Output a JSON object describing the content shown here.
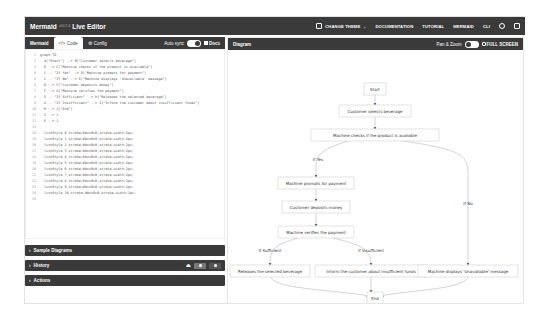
{
  "navbar": {
    "brand": "Mermaid",
    "version": "v10.2.4",
    "product": "Live Editor",
    "links": [
      "CHANGE THEME",
      "DOCUMENTATION",
      "TUTORIAL",
      "MERMAID",
      "CLI"
    ],
    "icons": [
      "theme-icon",
      "github-icon",
      "mermaid-chart-icon"
    ]
  },
  "editor": {
    "title": "Mermaid",
    "tabs": [
      {
        "label": "Code",
        "icon": "code-icon",
        "active": true
      },
      {
        "label": "Config",
        "icon": "config-icon",
        "active": false
      }
    ],
    "auto_sync_label": "Auto sync",
    "auto_sync_on": true,
    "docs_label": "Docs",
    "lines": [
      "graph TD",
      "  A[\"Start\"] --> B[\"Customer selects beverage\"]",
      "  B --> C{\"Machine checks if the product is available\"}",
      "  C -- \"If Yes\" --> D[\"Machine prompts for payment\"]",
      "  C -- \"If No\" --> E[\"Machine displays 'Unavailable' message\"]",
      "  D --> F[\"Customer deposits money\"]",
      "  F --> G{\"Machine verifies the payment\"}",
      "  G -- \"If Sufficient\" --> H[\"Releases the selected beverage\"]",
      "  G -- \"If Insufficient\" --> I[\"Inform the customer about insufficient funds\"]",
      "  H --> J[\"End\"]",
      "  I --> J",
      "  E --> J",
      "  ",
      "  linkStyle 0 stroke:#bcc0c0,stroke-width:2px;",
      "  linkStyle 1 stroke:#bcc0c0,stroke-width:2px;",
      "  linkStyle 2 stroke:#bcc0c0,stroke-width:2px;",
      "  linkStyle 3 stroke:#bcc0c0,stroke-width:2px;",
      "  linkStyle 4 stroke:#bcc0c0,stroke-width:2px;",
      "  linkStyle 5 stroke:#bcc0c0,stroke-width:2px;",
      "  linkStyle 6 stroke:#bcc0c0,stroke-width:2px;",
      "  linkStyle 7 stroke:#bcc0c0,stroke-width:2px;",
      "  linkStyle 8 stroke:#bcc0c0,stroke-width:2px;",
      "  linkStyle 9 stroke:#bcc0c0,stroke-width:2px;",
      "  linkStyle 10 stroke:#bcc0c0,stroke-width:2px;",
      ""
    ]
  },
  "accordions": [
    {
      "label": "Sample Diagrams"
    },
    {
      "label": "History"
    },
    {
      "label": "Actions"
    }
  ],
  "diagram": {
    "title": "Diagram",
    "pan_zoom_label": "Pan & Zoom",
    "pan_zoom_on": false,
    "full_screen_label": "FULL SCREEN",
    "nodes": {
      "start": "Start",
      "select": "Customer selects beverage",
      "check": "Machine checks if the product is available",
      "prompt": "Machine prompts for payment",
      "deposit": "Customer deposits money",
      "verify": "Machine verifies the payment",
      "release": "Releases the selected beverage",
      "inform": "Inform the customer about insufficient funds",
      "unavail": "Machine displays 'Unavailable' message",
      "end": "End"
    },
    "edge_labels": {
      "yes": "If Yes",
      "no": "If No",
      "sufficient": "If Sufficient",
      "insufficient": "If Insufficient"
    }
  }
}
